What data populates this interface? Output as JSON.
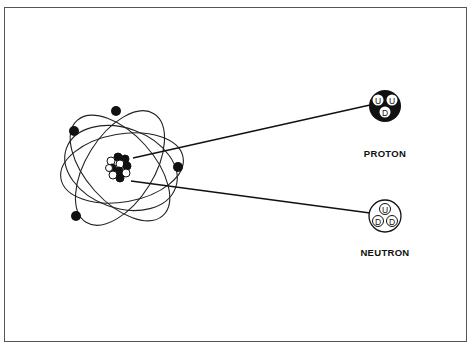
{
  "diagram": {
    "type": "atom-structure",
    "atom": {
      "electrons": 4,
      "orbits": 3
    },
    "particles": [
      {
        "name": "PROTON",
        "quarks": [
          "U",
          "U",
          "D"
        ],
        "fill": "#111111"
      },
      {
        "name": "NEUTRON",
        "quarks": [
          "U",
          "D",
          "D"
        ],
        "fill": "#ffffff"
      }
    ]
  },
  "labels": {
    "proton": "PROTON",
    "neutron": "NEUTRON",
    "proton_q1": "U",
    "proton_q2": "U",
    "proton_q3": "D",
    "neutron_q1": "U",
    "neutron_q2": "D",
    "neutron_q3": "D"
  },
  "colors": {
    "ink": "#111111",
    "paper": "#ffffff",
    "border": "#555555"
  }
}
